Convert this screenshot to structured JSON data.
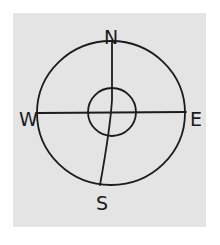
{
  "diagram": {
    "type": "compass-rose",
    "style": "hand-drawn pencil sketch on paper",
    "colors": {
      "background": "#ffffff",
      "paper": "#e4e4e4",
      "ink": "#1c1c1c"
    },
    "labels": {
      "north": "N",
      "south": "S",
      "east": "E",
      "west": "W"
    },
    "shapes": {
      "outer_circle": {
        "cx": 111,
        "cy": 113,
        "rx": 74,
        "ry": 72
      },
      "inner_circle": {
        "cx": 112,
        "cy": 112,
        "r": 24
      },
      "horizontal_line": {
        "x1": 38,
        "y1": 113,
        "x2": 186,
        "y2": 112
      },
      "vertical_line": {
        "x1": 112,
        "y1": 41,
        "x2": 100,
        "y2": 185
      }
    }
  }
}
